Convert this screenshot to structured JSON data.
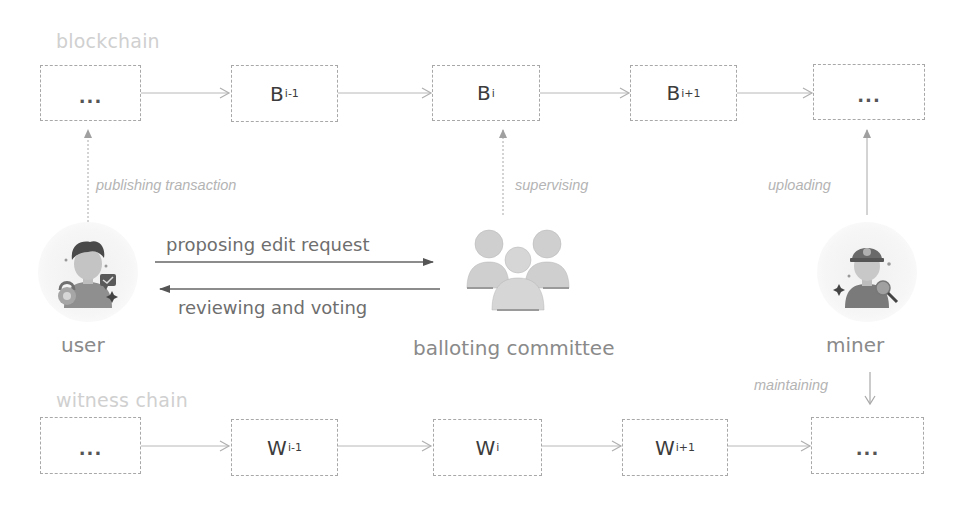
{
  "blockchain": {
    "label": "blockchain",
    "blocks": [
      {
        "main": "...",
        "sub": ""
      },
      {
        "main": "B",
        "sub": "i-1"
      },
      {
        "main": "B",
        "sub": "i"
      },
      {
        "main": "B",
        "sub": "i+1"
      },
      {
        "main": "...",
        "sub": ""
      }
    ]
  },
  "witness_chain": {
    "label": "witness chain",
    "blocks": [
      {
        "main": "...",
        "sub": ""
      },
      {
        "main": "W",
        "sub": "i-1"
      },
      {
        "main": "W",
        "sub": "i"
      },
      {
        "main": "W",
        "sub": "i+1"
      },
      {
        "main": "...",
        "sub": ""
      }
    ]
  },
  "actors": {
    "user": {
      "label": "user",
      "icon": "user-avatar-icon"
    },
    "committee": {
      "label": "balloting committee",
      "icon": "group-icon"
    },
    "miner": {
      "label": "miner",
      "icon": "miner-avatar-icon"
    }
  },
  "edges": {
    "publishing": "publishing transaction",
    "supervising": "supervising",
    "uploading": "uploading",
    "maintaining": "maintaining",
    "proposing": "proposing edit request",
    "reviewing": "reviewing and voting"
  },
  "colors": {
    "box_border": "#a8a8a8",
    "arrow": "#b0b0b0",
    "message_arrow": "#5a5a5a",
    "section_label": "#d0d0d0",
    "edge_label": "#b4b4b4",
    "icon_gray": "#cfcfcf"
  }
}
